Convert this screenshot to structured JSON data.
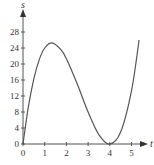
{
  "chart_data": {
    "type": "line",
    "title": "",
    "xlabel": "t",
    "ylabel": "s",
    "xticks": [
      "0",
      "1",
      "2",
      "3",
      "4",
      "5"
    ],
    "yticks": [
      "0",
      "4",
      "8",
      "12",
      "16",
      "20",
      "24",
      "28"
    ],
    "xlim": [
      0,
      5.4
    ],
    "ylim": [
      0,
      30
    ],
    "grid": false,
    "series": [
      {
        "name": "s(t)",
        "x": [
          0,
          0.25,
          0.5,
          0.75,
          1.0,
          1.33,
          1.75,
          2.0,
          2.5,
          3.0,
          3.5,
          4.0,
          4.5,
          5.0,
          5.35
        ],
        "values": [
          0,
          9.4,
          16.3,
          21.1,
          24.0,
          25.3,
          23.6,
          21.3,
          15.0,
          8.0,
          2.3,
          0,
          3.0,
          13.3,
          26.0
        ]
      }
    ]
  },
  "axis": {
    "x_label": "t",
    "y_label": "s"
  }
}
